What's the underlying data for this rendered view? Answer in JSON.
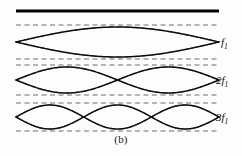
{
  "figure": {
    "caption": "(b)",
    "colors": {
      "solid_wave": "#0d0d0d",
      "dashed_wave": "#6f6f6f",
      "support_bar": "#000000",
      "background": "#fdfdfd",
      "text": "#0b0b0b"
    },
    "support_bar": {
      "name": "support-bar",
      "x_start": 16,
      "x_end": 219,
      "y": 11,
      "thickness": 3
    },
    "geometry": {
      "x_start": 16,
      "x_end": 219,
      "samples": 240
    },
    "harmonics": [
      {
        "id": "harmonic-1",
        "label_prefix": "",
        "label_symbol": "f",
        "label_subscript": "1",
        "label_text": "f1",
        "loops": 1,
        "center_y": 42,
        "amplitude": 15,
        "envelope_amplitude": 17
      },
      {
        "id": "harmonic-2",
        "label_prefix": "2",
        "label_symbol": "f",
        "label_subscript": "1",
        "label_text": "2f1",
        "loops": 2,
        "center_y": 80,
        "amplitude": 13,
        "envelope_amplitude": 15
      },
      {
        "id": "harmonic-3",
        "label_prefix": "3",
        "label_symbol": "f",
        "label_subscript": "1",
        "label_text": "3f1",
        "loops": 3,
        "center_y": 117,
        "amplitude": 12,
        "envelope_amplitude": 14
      }
    ]
  }
}
